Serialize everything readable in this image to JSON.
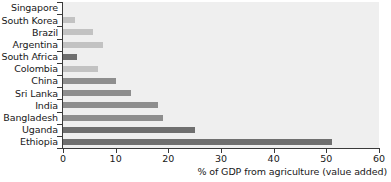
{
  "chart_data": {
    "type": "bar",
    "orientation": "horizontal",
    "title": "",
    "subtitle": "",
    "xlabel": "% of GDP from agriculture (value added)",
    "ylabel": "",
    "xlim": [
      0,
      60
    ],
    "xticks": [
      "0",
      "10",
      "20",
      "30",
      "40",
      "50",
      "60"
    ],
    "xtick_values": [
      0,
      10,
      20,
      30,
      40,
      50,
      60
    ],
    "grid": false,
    "legend": null,
    "categories": [
      "Singapore",
      "South Korea",
      "Brazil",
      "Argentina",
      "South Africa",
      "Colombia",
      "China",
      "Sri Lanka",
      "India",
      "Bangladesh",
      "Uganda",
      "Ethiopia"
    ],
    "values": [
      0,
      2.3,
      5.7,
      7.6,
      2.6,
      6.7,
      10,
      13,
      18,
      19,
      25,
      51
    ],
    "bar_shades": [
      "light",
      "light",
      "light",
      "light",
      "dark",
      "light",
      "mid",
      "mid",
      "mid",
      "mid",
      "dark",
      "dark"
    ],
    "series": [
      {
        "name": "% of GDP from agriculture (value added)",
        "values": [
          0,
          2.3,
          5.7,
          7.6,
          2.6,
          6.7,
          10,
          13,
          18,
          19,
          25,
          51
        ]
      }
    ]
  },
  "colors": {
    "plot_background": "#efefef",
    "page_background": "#ffffff",
    "bar_light": "#c2c2c2",
    "bar_mid": "#8e8e8e",
    "bar_dark": "#6f6f6f",
    "axis": "#3a3a3a",
    "text": "#181818"
  }
}
